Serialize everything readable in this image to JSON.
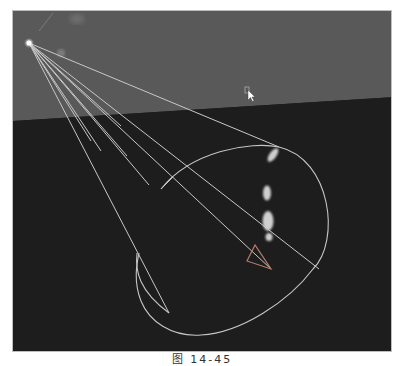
{
  "viewport": {
    "label": "3D viewport - spot light manipulator",
    "colors": {
      "background_plane": "#5a5a5a",
      "floor": "#1e1e1e",
      "manipulator_lines": "#c9c9c9",
      "highlight": "#d8d8d8"
    },
    "objects": [
      {
        "name": "spot-light-source",
        "x": 27,
        "y": 42
      },
      {
        "name": "cone-angle-circle"
      },
      {
        "name": "light-direction-arrow"
      },
      {
        "name": "specular-highlights",
        "count": 4
      },
      {
        "name": "mouse-cursor",
        "x": 248,
        "y": 93
      }
    ]
  },
  "caption": {
    "text": "图 14-45"
  }
}
